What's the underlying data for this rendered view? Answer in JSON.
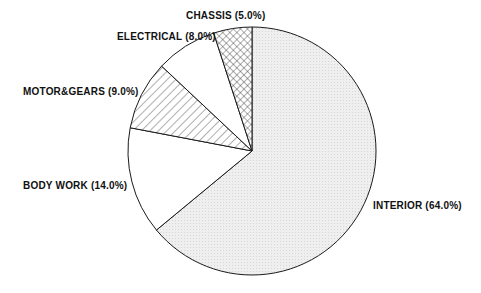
{
  "chart_data": {
    "type": "pie",
    "title": "",
    "start_angle_deg": 0,
    "direction": "clockwise",
    "slices": [
      {
        "label": "INTERIOR",
        "value": 64.0,
        "display": "INTERIOR (64.0%)",
        "pattern": "dots"
      },
      {
        "label": "BODY WORK",
        "value": 14.0,
        "display": "BODY WORK (14.0%)",
        "pattern": "none"
      },
      {
        "label": "MOTOR&GEARS",
        "value": 9.0,
        "display": "MOTOR&GEARS (9.0%)",
        "pattern": "diagonal"
      },
      {
        "label": "ELECTRICAL",
        "value": 8.0,
        "display": "ELECTRICAL (8.0%)",
        "pattern": "none"
      },
      {
        "label": "CHASSIS",
        "value": 5.0,
        "display": "CHASSIS (5.0%)",
        "pattern": "crosshatch"
      }
    ],
    "legend": "none (inline labels)"
  },
  "colors": {
    "stroke": "#1a1a1a",
    "dots_fill": "#ececec",
    "background": "#ffffff"
  },
  "labels": {
    "interior": "INTERIOR (64.0%)",
    "body_work": "BODY WORK (14.0%)",
    "motor_gears": "MOTOR&GEARS (9.0%)",
    "electrical": "ELECTRICAL (8.0%)",
    "chassis": "CHASSIS (5.0%)"
  }
}
